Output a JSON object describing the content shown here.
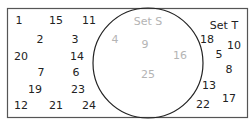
{
  "diagram": {
    "type": "venn",
    "colors": {
      "border": "#555555",
      "circle": "#222222",
      "outside_text": "#222222",
      "inside_text": "#b4b4b4"
    },
    "universal_set": {
      "label": "Set T",
      "elements": [
        {
          "value": "1",
          "x": 19,
          "y": 20
        },
        {
          "value": "15",
          "x": 56,
          "y": 20
        },
        {
          "value": "11",
          "x": 89,
          "y": 20
        },
        {
          "value": "2",
          "x": 40,
          "y": 39
        },
        {
          "value": "3",
          "x": 75,
          "y": 39
        },
        {
          "value": "20",
          "x": 21,
          "y": 56
        },
        {
          "value": "14",
          "x": 77,
          "y": 56
        },
        {
          "value": "7",
          "x": 41,
          "y": 72
        },
        {
          "value": "6",
          "x": 76,
          "y": 72
        },
        {
          "value": "19",
          "x": 35,
          "y": 89
        },
        {
          "value": "23",
          "x": 78,
          "y": 89
        },
        {
          "value": "12",
          "x": 21,
          "y": 105
        },
        {
          "value": "21",
          "x": 56,
          "y": 105
        },
        {
          "value": "24",
          "x": 89,
          "y": 105
        },
        {
          "value": "18",
          "x": 207,
          "y": 39
        },
        {
          "value": "10",
          "x": 234,
          "y": 45
        },
        {
          "value": "5",
          "x": 219,
          "y": 54
        },
        {
          "value": "8",
          "x": 229,
          "y": 69
        },
        {
          "value": "13",
          "x": 209,
          "y": 85
        },
        {
          "value": "17",
          "x": 229,
          "y": 98
        },
        {
          "value": "22",
          "x": 203,
          "y": 104
        }
      ],
      "label_pos": {
        "x": 224,
        "y": 25
      }
    },
    "subset": {
      "label": "Set S",
      "label_pos": {
        "x": 148,
        "y": 21
      },
      "elements": [
        {
          "value": "4",
          "x": 115,
          "y": 39
        },
        {
          "value": "9",
          "x": 145,
          "y": 44
        },
        {
          "value": "16",
          "x": 180,
          "y": 55
        },
        {
          "value": "25",
          "x": 148,
          "y": 74
        }
      ]
    }
  }
}
